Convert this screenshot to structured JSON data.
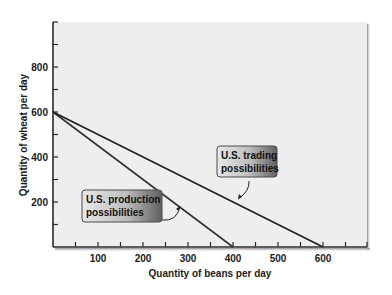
{
  "chart_data": {
    "type": "line",
    "title": "",
    "xlabel": "Quantity of beans per day",
    "ylabel": "Quantity of wheat per day",
    "xlim": [
      0,
      700
    ],
    "ylim": [
      0,
      1000
    ],
    "x_ticks": [
      100,
      200,
      300,
      400,
      500,
      600
    ],
    "x_minor_tick_step": 50,
    "y_ticks": [
      200,
      400,
      600,
      800
    ],
    "y_minor_tick_step": 100,
    "grid": false,
    "legend": "none (callout labels)",
    "series": [
      {
        "name": "U.S. production possibilities",
        "x": [
          0,
          400
        ],
        "y": [
          600,
          0
        ],
        "color": "#333333"
      },
      {
        "name": "U.S. trading possibilities",
        "x": [
          0,
          600
        ],
        "y": [
          600,
          0
        ],
        "color": "#1f1f1f"
      }
    ],
    "annotations": [
      {
        "text_line1": "U.S. production",
        "text_line2": "possibilities",
        "points_to": "U.S. production possibilities",
        "box_x": 82,
        "box_y": 190,
        "box_w": 80,
        "box_h": 32,
        "arrow_target": [
          180,
          206
        ]
      },
      {
        "text_line1": "U.S. trading",
        "text_line2": "possibilities",
        "points_to": "U.S. trading possibilities",
        "box_x": 217,
        "box_y": 146,
        "box_w": 60,
        "box_h": 31,
        "arrow_target": [
          238,
          199
        ]
      }
    ]
  },
  "colors": {
    "plot_background": "#eeeeee",
    "axis": "#2a2a2a",
    "panel_shadow": "#9a9a9a",
    "callout_fill_light": "#e6e6e6",
    "callout_fill_dark": "#6e6e6e",
    "callout_border": "#4a4a4a"
  }
}
